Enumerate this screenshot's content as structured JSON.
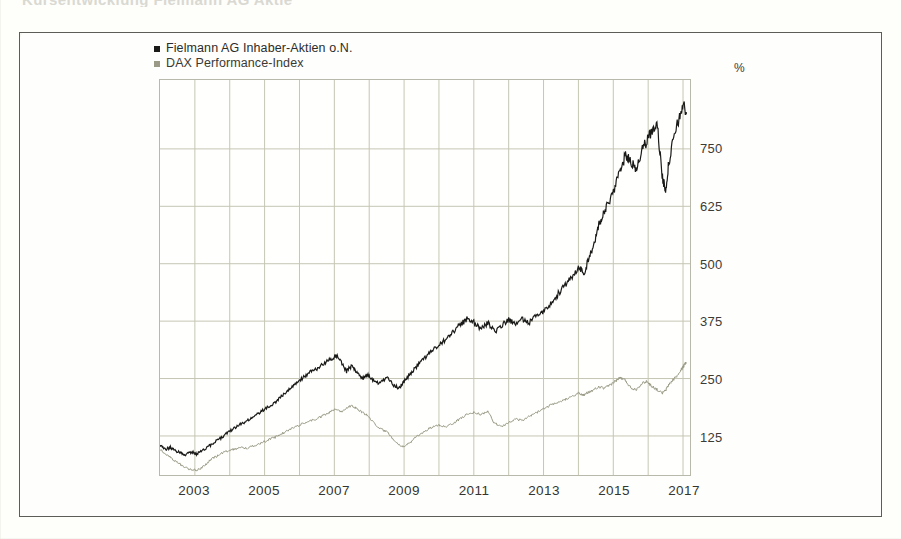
{
  "page": {
    "cut_off_heading": "Kursentwicklung Fielmann AG  Aktie",
    "background_color": "#fefefb",
    "frame_border_color": "#5d5d57"
  },
  "legend": {
    "position": "top-left-inside-frame",
    "entries": [
      {
        "label": "Fielmann AG Inhaber-Aktien o.N.",
        "color": "#1a1a18",
        "marker": "square-marker"
      },
      {
        "label": "DAX Performance-Index",
        "color": "#8c8c78",
        "marker": "square-marker"
      }
    ]
  },
  "axes": {
    "y_unit": "%",
    "y_ticks": [
      "125",
      "250",
      "375",
      "500",
      "625",
      "750"
    ],
    "x_ticks": [
      "2003",
      "2005",
      "2007",
      "2009",
      "2011",
      "2013",
      "2015",
      "2017"
    ]
  },
  "chart_data": {
    "type": "line",
    "title": "Kursentwicklung Fielmann AG  Aktie",
    "xlabel": "",
    "ylabel": "%",
    "ylim": [
      40,
      900
    ],
    "xlim": [
      2002.0,
      2017.2
    ],
    "grid": true,
    "legend_position": "top-left",
    "y_ticks": [
      125,
      250,
      375,
      500,
      625,
      750
    ],
    "x_ticks": [
      2003,
      2005,
      2007,
      2009,
      2011,
      2013,
      2015,
      2017
    ],
    "x_gridline_years": [
      2003,
      2004,
      2005,
      2006,
      2007,
      2008,
      2009,
      2010,
      2011,
      2012,
      2013,
      2014,
      2015,
      2016,
      2017
    ],
    "series": [
      {
        "name": "Fielmann AG Inhaber-Aktien o.N.",
        "color": "#1a1a18",
        "x": [
          2002.0,
          2002.15,
          2002.3,
          2002.45,
          2002.6,
          2002.75,
          2002.9,
          2003.05,
          2003.2,
          2003.35,
          2003.5,
          2003.7,
          2003.9,
          2004.1,
          2004.3,
          2004.5,
          2004.7,
          2004.9,
          2005.1,
          2005.3,
          2005.5,
          2005.7,
          2005.9,
          2006.1,
          2006.3,
          2006.5,
          2006.7,
          2006.9,
          2007.05,
          2007.2,
          2007.35,
          2007.5,
          2007.65,
          2007.8,
          2007.95,
          2008.1,
          2008.3,
          2008.5,
          2008.7,
          2008.85,
          2009.0,
          2009.2,
          2009.4,
          2009.6,
          2009.8,
          2010.0,
          2010.2,
          2010.4,
          2010.6,
          2010.8,
          2011.0,
          2011.2,
          2011.4,
          2011.6,
          2011.8,
          2012.0,
          2012.2,
          2012.4,
          2012.6,
          2012.8,
          2013.0,
          2013.2,
          2013.4,
          2013.6,
          2013.8,
          2014.0,
          2014.15,
          2014.3,
          2014.45,
          2014.6,
          2014.75,
          2014.9,
          2015.05,
          2015.2,
          2015.35,
          2015.5,
          2015.65,
          2015.8,
          2015.95,
          2016.1,
          2016.25,
          2016.4,
          2016.5,
          2016.6,
          2016.75,
          2016.9,
          2017.0,
          2017.1
        ],
        "y": [
          104,
          96,
          100,
          92,
          88,
          84,
          90,
          86,
          92,
          100,
          108,
          118,
          130,
          140,
          150,
          158,
          168,
          178,
          188,
          198,
          212,
          226,
          240,
          252,
          264,
          272,
          282,
          292,
          300,
          286,
          266,
          278,
          262,
          250,
          258,
          246,
          240,
          252,
          236,
          228,
          244,
          262,
          280,
          296,
          310,
          322,
          336,
          352,
          366,
          380,
          372,
          358,
          372,
          352,
          366,
          378,
          368,
          380,
          372,
          386,
          398,
          414,
          432,
          452,
          470,
          492,
          478,
          510,
          546,
          586,
          612,
          640,
          668,
          700,
          736,
          724,
          706,
          742,
          766,
          788,
          812,
          690,
          662,
          724,
          778,
          820,
          846,
          830
        ],
        "end_value": 830,
        "start_value": 104,
        "max_value": 846,
        "min_value": 84
      },
      {
        "name": "DAX Performance-Index",
        "color": "#8c8c78",
        "x": [
          2002.0,
          2002.15,
          2002.3,
          2002.45,
          2002.6,
          2002.75,
          2002.9,
          2003.05,
          2003.2,
          2003.35,
          2003.5,
          2003.7,
          2003.9,
          2004.1,
          2004.3,
          2004.5,
          2004.7,
          2004.9,
          2005.1,
          2005.3,
          2005.5,
          2005.7,
          2005.9,
          2006.1,
          2006.3,
          2006.5,
          2006.7,
          2006.9,
          2007.05,
          2007.2,
          2007.35,
          2007.5,
          2007.65,
          2007.8,
          2007.95,
          2008.1,
          2008.3,
          2008.5,
          2008.7,
          2008.85,
          2009.0,
          2009.2,
          2009.4,
          2009.6,
          2009.8,
          2010.0,
          2010.2,
          2010.4,
          2010.6,
          2010.8,
          2011.0,
          2011.2,
          2011.4,
          2011.6,
          2011.8,
          2012.0,
          2012.2,
          2012.4,
          2012.6,
          2012.8,
          2013.0,
          2013.2,
          2013.4,
          2013.6,
          2013.8,
          2014.0,
          2014.15,
          2014.3,
          2014.45,
          2014.6,
          2014.75,
          2014.9,
          2015.05,
          2015.2,
          2015.35,
          2015.5,
          2015.65,
          2015.8,
          2015.95,
          2016.1,
          2016.25,
          2016.4,
          2016.5,
          2016.6,
          2016.75,
          2016.9,
          2017.0,
          2017.1
        ],
        "y": [
          96,
          86,
          78,
          70,
          62,
          56,
          52,
          50,
          56,
          66,
          76,
          84,
          92,
          96,
          100,
          98,
          104,
          110,
          116,
          122,
          130,
          138,
          146,
          152,
          158,
          162,
          170,
          178,
          184,
          178,
          186,
          192,
          184,
          176,
          170,
          156,
          142,
          134,
          118,
          106,
          102,
          112,
          126,
          136,
          144,
          148,
          146,
          152,
          162,
          172,
          176,
          172,
          178,
          152,
          146,
          154,
          162,
          158,
          168,
          176,
          184,
          192,
          196,
          204,
          212,
          218,
          214,
          220,
          226,
          232,
          228,
          236,
          244,
          252,
          246,
          230,
          226,
          238,
          244,
          234,
          226,
          218,
          224,
          238,
          250,
          262,
          276,
          286
        ],
        "end_value": 286,
        "start_value": 96,
        "max_value": 286,
        "min_value": 50
      }
    ]
  }
}
